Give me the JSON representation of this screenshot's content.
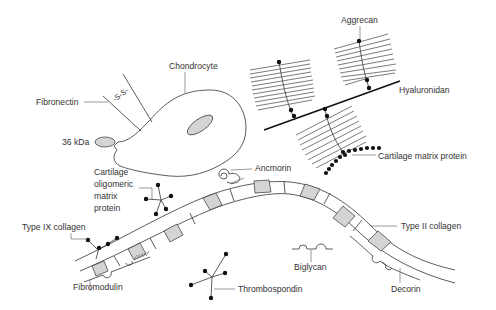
{
  "figure": {
    "type": "schematic",
    "background": "#ffffff",
    "line_color": "#333333",
    "fill_color": "#d4d4d4"
  },
  "labels": {
    "chondrocyte": "Chondrocyte",
    "fibronectin": "Fibronectin",
    "disulfide": "-S-S-",
    "kda36": "36 kDa",
    "aggrecan": "Aggrecan",
    "hyaluronidan": "Hyaluronidan",
    "cartilage_matrix_protein": "Cartilage matrix protein",
    "ancmorin": "Ancmorin",
    "comp_line1": "Cartilage",
    "comp_line2": "oligomeric",
    "comp_line3": "matrix",
    "comp_line4": "protein",
    "type_ix_collagen": "Type IX collagen",
    "type_ii_collagen": "Type II collagen",
    "biglycan": "Biglycan",
    "fibromodulin": "Fibromodulin",
    "thrombospondin": "Thrombospondin",
    "decorin": "Decorin"
  },
  "components": [
    {
      "name": "Chondrocyte",
      "shape": "cell with grey oval nucleus"
    },
    {
      "name": "Fibronectin",
      "shape": "two strands with -S-S- bond"
    },
    {
      "name": "36 kDa",
      "shape": "grey oval"
    },
    {
      "name": "Aggrecan",
      "shape": "bristle monomers on hyaluronan"
    },
    {
      "name": "Hyaluronidan",
      "shape": "thick straight line"
    },
    {
      "name": "Cartilage matrix protein",
      "shape": "beaded chain"
    },
    {
      "name": "Ancmorin",
      "shape": "spiral"
    },
    {
      "name": "Cartilage oligomeric matrix protein",
      "shape": "five-armed star"
    },
    {
      "name": "Type IX collagen",
      "shape": "kinked arm with dots"
    },
    {
      "name": "Type II collagen",
      "shape": "banded fibril"
    },
    {
      "name": "Biglycan",
      "shape": "line with two loops"
    },
    {
      "name": "Fibromodulin",
      "shape": "loop on fibril"
    },
    {
      "name": "Thrombospondin",
      "shape": "branched star"
    },
    {
      "name": "Decorin",
      "shape": "loops on fibril"
    }
  ]
}
